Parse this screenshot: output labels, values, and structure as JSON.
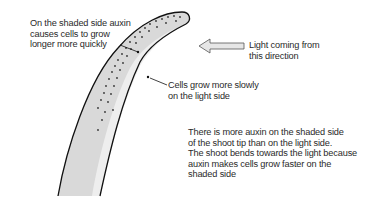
{
  "diagram": {
    "labels": {
      "shaded_side": [
        "On the shaded side auxin",
        "causes cells to grow",
        "longer more quickly"
      ],
      "light_direction": [
        "Light coming from",
        "this direction"
      ],
      "light_side": [
        "Cells grow more slowly",
        "on the light side"
      ],
      "explanation": [
        "There is more auxin on the shaded side",
        "of the shoot tip than on the light side.",
        "The shoot bends towards the light because",
        "auxin makes cells grow faster on the",
        "shaded side"
      ]
    },
    "colors": {
      "shoot_fill": "#d9d9d9",
      "shoot_light_band": "#eeeeee",
      "outline": "#111111",
      "arrow_fill": "#e6e6e6",
      "text": "#2a2a2a"
    }
  }
}
